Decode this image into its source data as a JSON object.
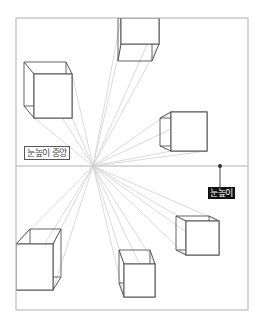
{
  "diagram": {
    "frame": {
      "x": 16,
      "y": 18,
      "w": 232,
      "h": 292
    },
    "horizon_y": 166,
    "vanishing_point": {
      "x": 93,
      "y": 166
    },
    "labels": {
      "eye_level_center": "눈높이 중앙",
      "eye_level": "눈높이"
    },
    "eye_marker": {
      "x": 220,
      "y": 166,
      "label_y": 187
    },
    "colors": {
      "frame": "#b0b0b0",
      "guide_line": "#d0d0d0",
      "cube_edge": "#555555",
      "label_dark_bg": "#111111",
      "label_text_light": "#ffffff"
    },
    "cubes": [
      {
        "name": "top-center",
        "front": [
          121,
          18,
          159,
          44
        ],
        "back": [
          118,
          18,
          152,
          61
        ]
      },
      {
        "name": "top-left",
        "front": [
          34,
          74,
          72,
          118
        ],
        "back": [
          24,
          62,
          66,
          106
        ]
      },
      {
        "name": "right-middle",
        "front": [
          171,
          112,
          207,
          151
        ],
        "back": [
          160,
          118,
          196,
          146
        ]
      },
      {
        "name": "right-bottom",
        "front": [
          186,
          221,
          219,
          255
        ],
        "back": [
          176,
          216,
          209,
          250
        ]
      },
      {
        "name": "bottom-center",
        "front": [
          124,
          264,
          155,
          297
        ],
        "back": [
          119,
          250,
          150,
          283
        ]
      },
      {
        "name": "bottom-left",
        "front": [
          16,
          244,
          53,
          290
        ],
        "back": [
          30,
          229,
          61,
          277
        ]
      }
    ]
  }
}
